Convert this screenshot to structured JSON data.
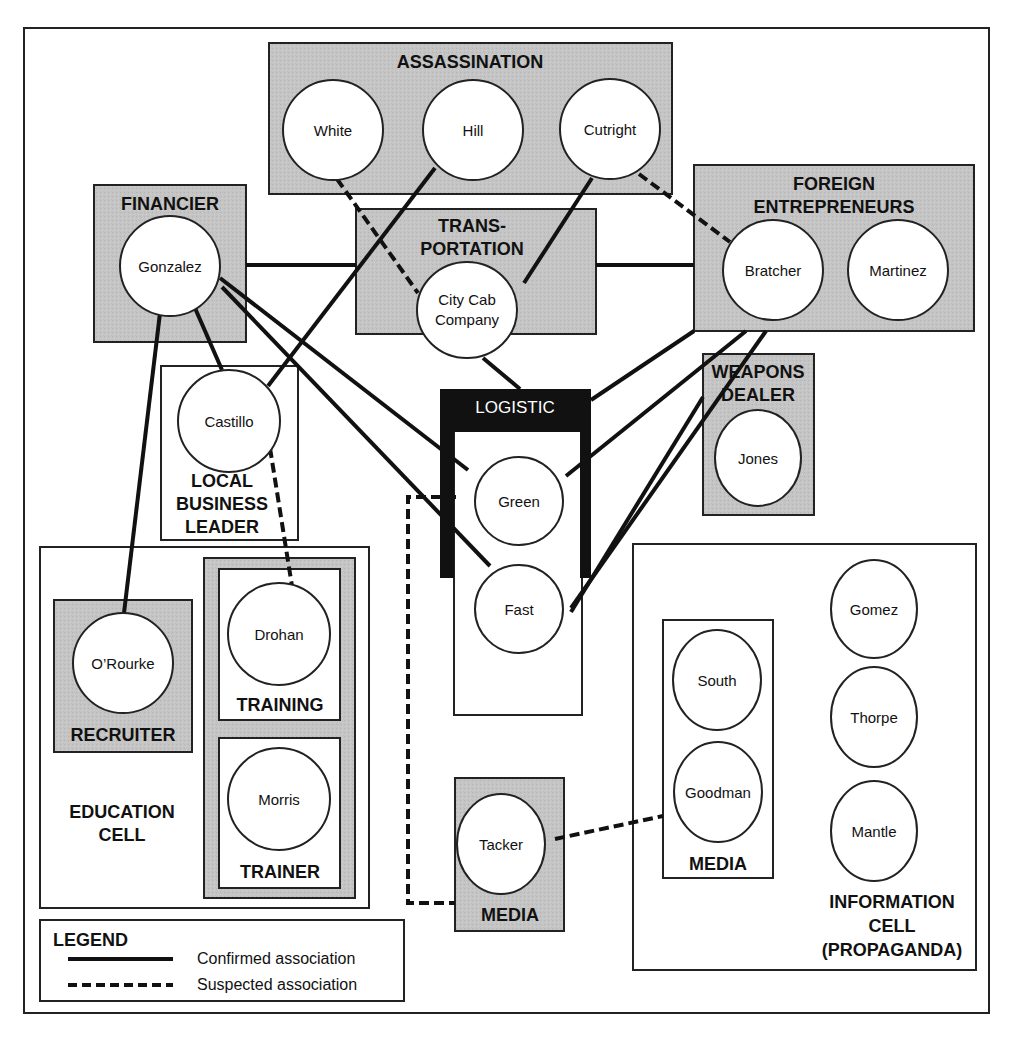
{
  "diagram": {
    "title": "",
    "colors": {
      "shaded": "#c8c8c8",
      "line": "#111111",
      "logistic": "#111111",
      "node_fill": "#ffffff"
    },
    "groups": {
      "assassination": "ASSASSINATION",
      "financier": "FINANCIER",
      "transportation_1": "TRANS-",
      "transportation_2": "PORTATION",
      "foreign_1": "FOREIGN",
      "foreign_2": "ENTREPRENEURS",
      "logistic": "LOGISTIC",
      "weapons_1": "WEAPONS",
      "weapons_2": "DEALER",
      "local_business_1": "LOCAL",
      "local_business_2": "BUSINESS",
      "local_business_3": "LEADER",
      "recruiter": "RECRUITER",
      "training": "TRAINING",
      "trainer": "TRAINER",
      "education_1": "EDUCATION",
      "education_2": "CELL",
      "media_tacker": "MEDIA",
      "media_inner": "MEDIA",
      "information_1": "INFORMATION",
      "information_2": "CELL",
      "information_3": "(PROPAGANDA)"
    },
    "nodes": {
      "white": "White",
      "hill": "Hill",
      "cutright": "Cutright",
      "gonzalez": "Gonzalez",
      "city_cab_1": "City Cab",
      "city_cab_2": "Company",
      "bratcher": "Bratcher",
      "martinez": "Martinez",
      "castillo": "Castillo",
      "green": "Green",
      "fast": "Fast",
      "jones": "Jones",
      "orourke": "O’Rourke",
      "drohan": "Drohan",
      "morris": "Morris",
      "tacker": "Tacker",
      "south": "South",
      "goodman": "Goodman",
      "gomez": "Gomez",
      "thorpe": "Thorpe",
      "mantle": "Mantle"
    },
    "edges": [
      {
        "from": "Gonzalez",
        "to": "Transportation",
        "type": "confirmed"
      },
      {
        "from": "Transportation",
        "to": "Foreign Entrepreneurs",
        "type": "confirmed"
      },
      {
        "from": "Gonzalez",
        "to": "Castillo",
        "type": "confirmed"
      },
      {
        "from": "Gonzalez",
        "to": "O'Rourke",
        "type": "confirmed"
      },
      {
        "from": "Gonzalez",
        "to": "Green",
        "type": "confirmed"
      },
      {
        "from": "Gonzalez",
        "to": "Fast",
        "type": "confirmed"
      },
      {
        "from": "Hill",
        "to": "Castillo",
        "type": "confirmed"
      },
      {
        "from": "Cutright",
        "to": "City Cab Company",
        "type": "confirmed"
      },
      {
        "from": "City Cab Company",
        "to": "Logistic",
        "type": "confirmed"
      },
      {
        "from": "Foreign Entrepreneurs",
        "to": "Logistic",
        "type": "confirmed"
      },
      {
        "from": "Foreign Entrepreneurs",
        "to": "Green",
        "type": "confirmed"
      },
      {
        "from": "Foreign Entrepreneurs",
        "to": "Fast",
        "type": "confirmed"
      },
      {
        "from": "Weapons Dealer",
        "to": "Fast",
        "type": "confirmed"
      },
      {
        "from": "White",
        "to": "City Cab Company",
        "type": "suspected"
      },
      {
        "from": "Cutright",
        "to": "Bratcher",
        "type": "suspected"
      },
      {
        "from": "Castillo",
        "to": "Drohan",
        "type": "suspected"
      },
      {
        "from": "Green",
        "to": "Tacker",
        "type": "suspected"
      },
      {
        "from": "Tacker",
        "to": "Goodman",
        "type": "suspected"
      }
    ],
    "legend": {
      "title": "LEGEND",
      "confirmed": "Confirmed association",
      "suspected": "Suspected association"
    }
  }
}
